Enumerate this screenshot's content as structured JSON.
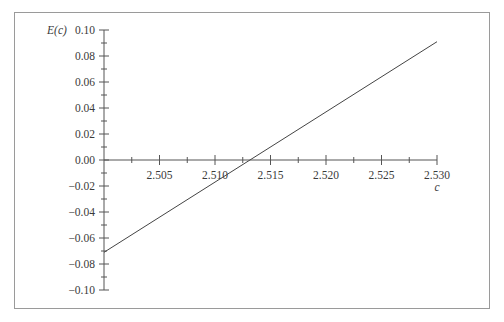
{
  "chart_data": {
    "type": "line",
    "title": "",
    "xlabel": "c",
    "ylabel": "E(c)",
    "xlim": [
      2.5,
      2.53
    ],
    "ylim": [
      -0.1,
      0.1
    ],
    "x_ticks": [
      "2.505",
      "2.510",
      "2.515",
      "2.520",
      "2.525",
      "2.530"
    ],
    "y_ticks": [
      "0.10",
      "0.08",
      "0.06",
      "0.04",
      "0.02",
      "0.00",
      "-0.02",
      "-0.04",
      "-0.06",
      "-0.08",
      "-0.10"
    ],
    "grid": false,
    "legend": null,
    "series": [
      {
        "name": "E(c)",
        "x": [
          2.5,
          2.53
        ],
        "y": [
          -0.071,
          0.091
        ]
      }
    ],
    "annotations": {
      "zero_crossing_c": 2.5132
    }
  }
}
